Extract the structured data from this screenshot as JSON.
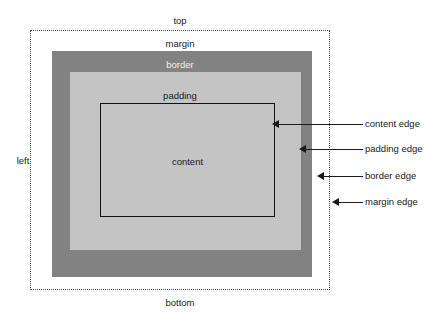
{
  "diagram": {
    "canvas": {
      "width": 434,
      "height": 319,
      "background": "#ffffff"
    },
    "regions": {
      "margin": {
        "label": "margin",
        "edge_style": "dotted",
        "edge_color": "#4a4a4a",
        "fill": "#ffffff"
      },
      "border": {
        "label": "border",
        "fill": "#828282",
        "label_color": "#f2f2f2"
      },
      "padding": {
        "label": "padding",
        "fill": "#c4c4c4",
        "label_color": "#1a1a1a"
      },
      "content": {
        "label": "content",
        "fill": "#c4c4c4",
        "outline_color": "#111111",
        "label_color": "#1a1a1a"
      }
    },
    "side_labels": {
      "top": "top",
      "bottom": "bottom",
      "left": "left"
    },
    "callouts": [
      {
        "label": "content edge",
        "target": "content-box-outline"
      },
      {
        "label": "padding edge",
        "target": "padding-box-outline"
      },
      {
        "label": "border edge",
        "target": "border-box-outline"
      },
      {
        "label": "margin edge",
        "target": "margin-box-outline"
      }
    ]
  }
}
